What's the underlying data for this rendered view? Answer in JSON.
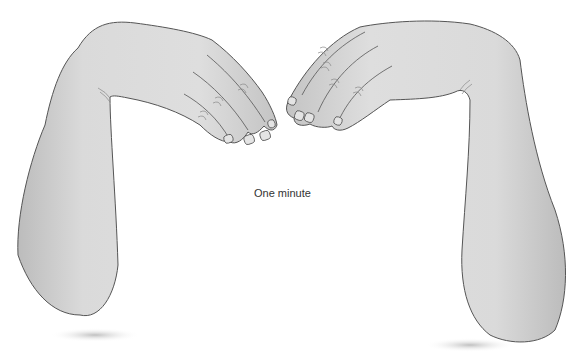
{
  "figure": {
    "caption": "One minute",
    "colors": {
      "skin_fill": "#d6d6d6",
      "skin_highlight": "#e6e6e6",
      "outline": "#555555",
      "shadow": "#bdbdbd",
      "background": "#ffffff",
      "text": "#333333"
    }
  }
}
